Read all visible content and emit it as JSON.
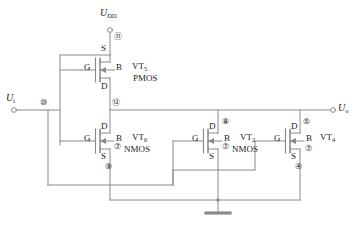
{
  "figure": {
    "kind": "circuit-schematic",
    "caption": "",
    "line_color": "#8a8a8a",
    "text_color": "#222222"
  },
  "terminals": {
    "supply": {
      "label": "U",
      "sub": "DD",
      "node": "⑪"
    },
    "input": {
      "label": "U",
      "sub": "i",
      "node": "⑩"
    },
    "output": {
      "label": "U",
      "sub": "o",
      "node": ""
    }
  },
  "nodes": {
    "supply": "⑪",
    "input": "⑩",
    "mid": "⑫",
    "vt6_source": "⑨",
    "vt2_drain": "⑧",
    "vt4_drain": "⑤",
    "vt4_source": "④",
    "body_common": "⑦"
  },
  "transistors": [
    {
      "id": "vt5",
      "name": "VT",
      "sub": "5",
      "type": "PMOS",
      "pins": {
        "top": "S",
        "gate": "G",
        "body": "B",
        "bottom": "D"
      },
      "body_node": ""
    },
    {
      "id": "vt6",
      "name": "VT",
      "sub": "6",
      "type": "NMOS",
      "pins": {
        "top": "D",
        "gate": "G",
        "body": "B",
        "bottom": "S"
      },
      "body_node": "⑦"
    },
    {
      "id": "vt2",
      "name": "VT",
      "sub": "2",
      "type": "NMOS",
      "pins": {
        "top": "D",
        "gate": "G",
        "body": "B",
        "bottom": "S"
      },
      "body_node": "⑦"
    },
    {
      "id": "vt4",
      "name": "VT",
      "sub": "4",
      "type": "NMOS",
      "pins": {
        "top": "D",
        "gate": "G",
        "body": "B",
        "bottom": "S"
      },
      "body_node": "⑦"
    }
  ],
  "ground": {
    "name": "ground-symbol"
  }
}
